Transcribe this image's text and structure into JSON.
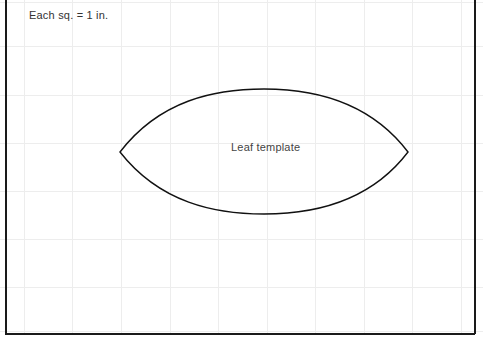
{
  "page": {
    "background_color": "#ffffff",
    "width": 483,
    "height": 346
  },
  "grid": {
    "spacing_px": 48,
    "color": "#ededed",
    "v_positions": [
      24,
      72,
      121,
      170,
      218,
      267,
      315,
      364,
      412,
      461
    ],
    "h_positions": [
      2,
      46,
      95,
      143,
      191,
      239,
      287,
      331
    ],
    "unit_label": "1 in."
  },
  "frame": {
    "color": "#1a1a1a",
    "left_x": 5,
    "right_x": 474,
    "bottom_y": 333
  },
  "annotations": {
    "scale_note": "Each sq. = 1 in.",
    "leaf_label": "Leaf template"
  },
  "shape": {
    "name": "leaf-template-outline",
    "type": "vesica",
    "stroke_color": "#111111",
    "stroke_width": 1.4,
    "fill": "none",
    "left_tip": [
      120,
      152
    ],
    "right_tip": [
      408,
      152
    ],
    "top_apex": [
      264,
      89
    ],
    "bottom_apex": [
      264,
      214
    ],
    "width_px": 288,
    "height_px": 125,
    "width_in": 6,
    "height_in": 2.6,
    "path": "M 120 152 C 160 100, 215 89, 264 89 C 313 89, 370 102, 408 152 C 370 202, 313 214, 264 214 C 215 214, 160 203, 120 152 Z"
  }
}
